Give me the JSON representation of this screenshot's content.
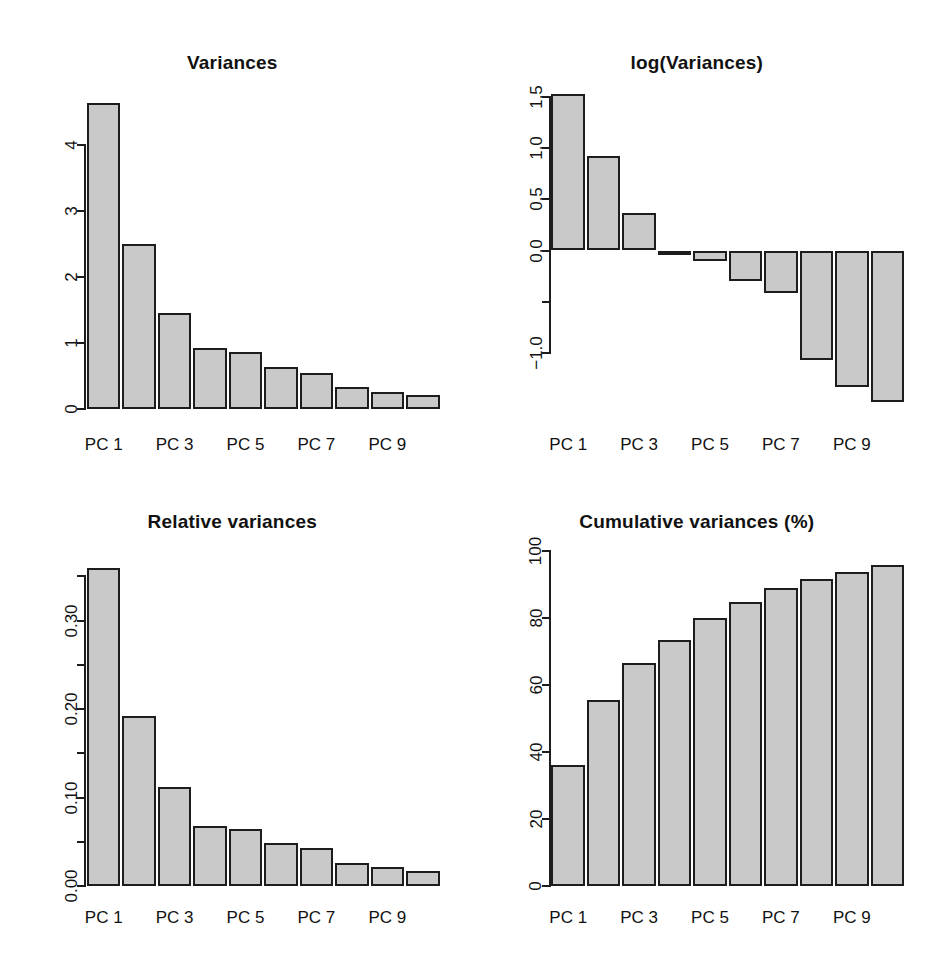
{
  "figure": {
    "kind": "pca-screeplot-panels",
    "background": "#ffffff",
    "bar_fill": "#c9c9c9",
    "bar_border": "#1d1d1d",
    "categories": [
      "PC 1",
      "PC 2",
      "PC 3",
      "PC 4",
      "PC 5",
      "PC 6",
      "PC 7",
      "PC 8",
      "PC 9",
      "PC 10"
    ],
    "tick_labels_shown": [
      "PC 1",
      "PC 3",
      "PC 5",
      "PC 7",
      "PC 9"
    ]
  },
  "panels": {
    "variances": {
      "title": "Variances"
    },
    "log_variances": {
      "title": "log(Variances)"
    },
    "relative_variances": {
      "title": "Relative variances"
    },
    "cumulative_variances": {
      "title": "Cumulative variances (%)"
    }
  },
  "chart_data": [
    {
      "type": "bar",
      "title": "Variances",
      "xlabel": "",
      "ylabel": "",
      "categories": [
        "PC 1",
        "PC 2",
        "PC 3",
        "PC 4",
        "PC 5",
        "PC 6",
        "PC 7",
        "PC 8",
        "PC 9",
        "PC 10"
      ],
      "values": [
        4.63,
        2.5,
        1.45,
        0.92,
        0.86,
        0.64,
        0.55,
        0.33,
        0.26,
        0.21
      ],
      "ylim": [
        0,
        4.8
      ],
      "yticks": [
        0,
        1,
        2,
        3,
        4
      ],
      "ytick_labels": [
        "0",
        "1",
        "2",
        "3",
        "4"
      ],
      "xtick_labels": [
        "PC 1",
        "PC 3",
        "PC 5",
        "PC 7",
        "PC 9"
      ],
      "xtick_positions": [
        1,
        3,
        5,
        7,
        9
      ],
      "grid": false,
      "legend": "none"
    },
    {
      "type": "bar",
      "title": "log(Variances)",
      "xlabel": "",
      "ylabel": "",
      "categories": [
        "PC 1",
        "PC 2",
        "PC 3",
        "PC 4",
        "PC 5",
        "PC 6",
        "PC 7",
        "PC 8",
        "PC 9",
        "PC 10"
      ],
      "values": [
        1.53,
        0.92,
        0.37,
        -0.04,
        -0.1,
        -0.3,
        -0.42,
        -1.07,
        -1.33,
        -1.48
      ],
      "ylim": [
        -1.55,
        1.55
      ],
      "yticks": [
        -1.0,
        -0.5,
        0.0,
        0.5,
        1.0,
        1.5
      ],
      "ytick_labels": [
        "-1.0",
        "",
        "0.0",
        "0.5",
        "1.0",
        "1.5"
      ],
      "xtick_labels": [
        "PC 1",
        "PC 3",
        "PC 5",
        "PC 7",
        "PC 9"
      ],
      "xtick_positions": [
        1,
        3,
        5,
        7,
        9
      ],
      "grid": false,
      "legend": "none"
    },
    {
      "type": "bar",
      "title": "Relative variances",
      "xlabel": "",
      "ylabel": "",
      "categories": [
        "PC 1",
        "PC 2",
        "PC 3",
        "PC 4",
        "PC 5",
        "PC 6",
        "PC 7",
        "PC 8",
        "PC 9",
        "PC 10"
      ],
      "values": [
        0.36,
        0.192,
        0.112,
        0.068,
        0.064,
        0.049,
        0.043,
        0.026,
        0.021,
        0.017
      ],
      "ylim": [
        0,
        0.372
      ],
      "yticks": [
        0.0,
        0.05,
        0.1,
        0.15,
        0.2,
        0.25,
        0.3,
        0.35
      ],
      "ytick_labels": [
        "0.00",
        "",
        "0.10",
        "",
        "0.20",
        "",
        "0.30",
        ""
      ],
      "xtick_labels": [
        "PC 1",
        "PC 3",
        "PC 5",
        "PC 7",
        "PC 9"
      ],
      "xtick_positions": [
        1,
        3,
        5,
        7,
        9
      ],
      "grid": false,
      "legend": "none"
    },
    {
      "type": "bar",
      "title": "Cumulative variances (%)",
      "xlabel": "",
      "ylabel": "",
      "categories": [
        "PC 1",
        "PC 2",
        "PC 3",
        "PC 4",
        "PC 5",
        "PC 6",
        "PC 7",
        "PC 8",
        "PC 9",
        "PC 10"
      ],
      "values": [
        36.0,
        55.5,
        66.5,
        73.5,
        80.0,
        84.8,
        89.0,
        91.6,
        93.8,
        95.7
      ],
      "ylim": [
        0,
        100
      ],
      "yticks": [
        0,
        20,
        40,
        60,
        80,
        100
      ],
      "ytick_labels": [
        "0",
        "20",
        "40",
        "60",
        "80",
        "100"
      ],
      "xtick_labels": [
        "PC 1",
        "PC 3",
        "PC 5",
        "PC 7",
        "PC 9"
      ],
      "xtick_positions": [
        1,
        3,
        5,
        7,
        9
      ],
      "grid": false,
      "legend": "none"
    }
  ]
}
